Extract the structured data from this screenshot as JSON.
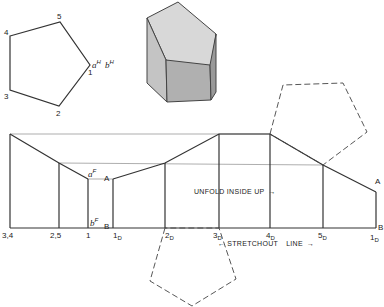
{
  "top_view": {
    "vertex_labels": [
      "4",
      "5",
      "1",
      "2",
      "3"
    ],
    "point_label_a": "a",
    "point_label_b": "b",
    "superscript": "H"
  },
  "isometric": {
    "description": "pentagonal prism truncated by oblique plane"
  },
  "development": {
    "base_labels": [
      "3,4",
      "2,5",
      "1",
      "1",
      "2",
      "3",
      "4",
      "5",
      "1"
    ],
    "developed_subscripts": [
      "D",
      "D",
      "D",
      "D",
      "D",
      "D"
    ],
    "top_point_a": "a",
    "bottom_point_b": "b",
    "fold_superscript": "F",
    "label_A": "A",
    "label_B": "B",
    "end_label_A": "A",
    "end_label_B": "B",
    "unfold_note": "UNFOLD INSIDE UP",
    "stretchout_note": "STRETCHOUT",
    "stretchout_line": "LINE",
    "arrow_right": "→",
    "arrow_left": "←"
  }
}
